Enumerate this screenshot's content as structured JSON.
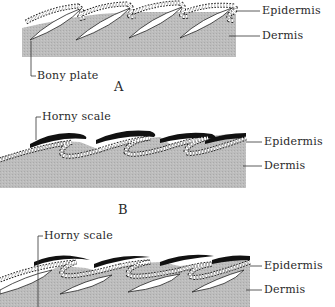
{
  "diagram": {
    "type": "biological cross-section",
    "colors": {
      "dermis": "#b9b9b9",
      "horny_scale": "#111111",
      "epidermis_outline": "#222222",
      "epidermis_fill": "#ffffff",
      "bony_plate": "#ffffff",
      "leader_line": "#333333"
    },
    "panels": [
      {
        "id": "A",
        "letter": "A",
        "labels": {
          "epidermis": "Epidermis",
          "dermis": "Dermis",
          "bony_plate": "Bony plate"
        }
      },
      {
        "id": "B",
        "letter": "B",
        "labels": {
          "horny_scale": "Horny scale",
          "epidermis": "Epidermis",
          "dermis": "Dermis"
        }
      },
      {
        "id": "C",
        "letter": "",
        "labels": {
          "horny_scale": "Horny scale",
          "epidermis": "Epidermis",
          "dermis": "Dermis"
        }
      }
    ]
  }
}
